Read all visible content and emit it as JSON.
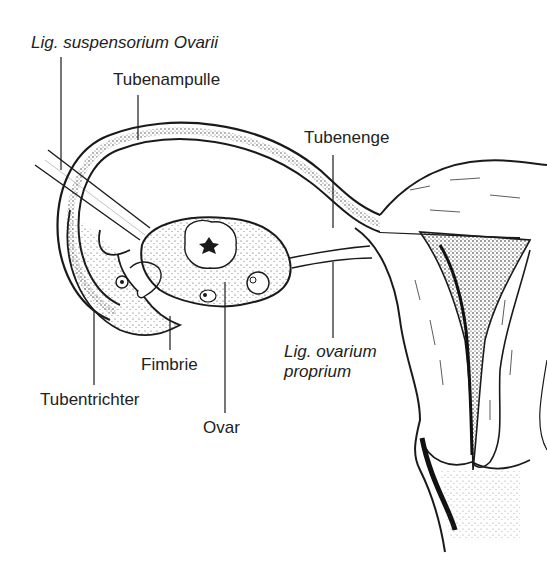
{
  "diagram": {
    "labels": {
      "lig_suspensorium": "Lig. suspensorium Ovarii",
      "tubenampulle": "Tubenampulle",
      "tubenenge": "Tubenenge",
      "fimbrie": "Fimbrie",
      "lig_ovarium_line1": "Lig. ovarium",
      "lig_ovarium_line2": "proprium",
      "tubentrichter": "Tubentrichter",
      "ovar": "Ovar"
    },
    "colors": {
      "ink": "#1a1a1a",
      "background": "#ffffff",
      "shading": "#555555"
    }
  }
}
